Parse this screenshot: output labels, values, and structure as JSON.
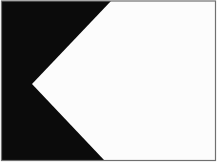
{
  "figure": {
    "name": "nautical-signal-flag",
    "colors": {
      "canvas_background": "#ffffff",
      "flag_field": "#0b0b0b",
      "wedge_fill": "#fcfcfc",
      "frame_border": "#707070"
    },
    "geometry": {
      "viewbox": "0 0 219 166",
      "wedge_points": "111,1 215.5,1 215.5,160 104,160 32,84"
    }
  }
}
